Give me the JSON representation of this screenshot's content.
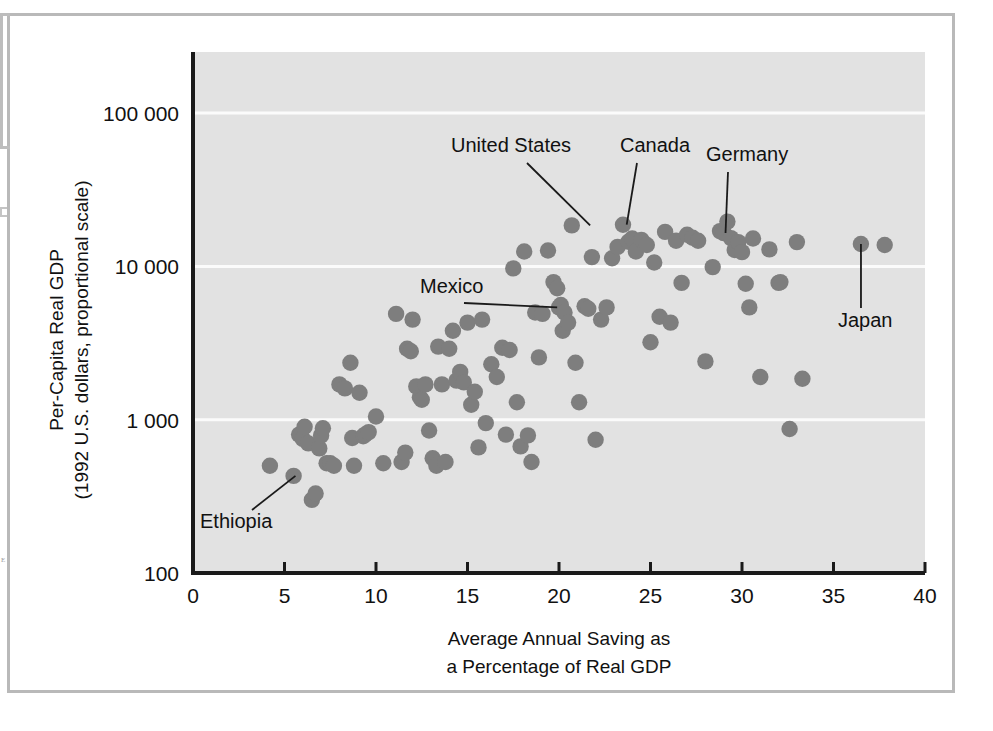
{
  "figure": {
    "plot_bg_color": "#e2e2e2",
    "point_color": "#7e7e7e",
    "grid_color": "#fbfbfb",
    "axis_color": "#1a1a1a",
    "margin_glyph": "E"
  },
  "axes": {
    "y_title_line1": "Per-Capita Real GDP",
    "y_title_line2": "(1992 U.S. dollars, proportional scale)",
    "x_title_line1": "Average Annual Saving as",
    "x_title_line2": "a Percentage of Real GDP",
    "y_tick_labels": [
      "100 000",
      "10 000",
      "1 000",
      "100"
    ],
    "x_tick_labels": [
      "0",
      "5",
      "10",
      "15",
      "20",
      "25",
      "30",
      "35",
      "40"
    ]
  },
  "annotations": [
    {
      "name": "United States",
      "label": "United States"
    },
    {
      "name": "Canada",
      "label": "Canada"
    },
    {
      "name": "Germany",
      "label": "Germany"
    },
    {
      "name": "Mexico",
      "label": "Mexico"
    },
    {
      "name": "Japan",
      "label": "Japan"
    },
    {
      "name": "Ethiopia",
      "label": "Ethiopia"
    }
  ],
  "chart_data": {
    "type": "scatter",
    "title": "",
    "xlabel": "Average Annual Saving as a Percentage of Real GDP",
    "ylabel": "Per-Capita Real GDP (1992 U.S. dollars, proportional scale)",
    "xlim": [
      0,
      40
    ],
    "ylim": [
      100,
      300000
    ],
    "yscale": "log",
    "xticks": [
      0,
      5,
      10,
      15,
      20,
      25,
      30,
      35,
      40
    ],
    "yticks": [
      100,
      1000,
      10000,
      100000
    ],
    "ytick_labels": [
      "100",
      "1 000",
      "10 000",
      "100 000"
    ],
    "grid": "horizontal-major-only",
    "legend": "none",
    "x": [
      4.2,
      5.5,
      5.8,
      6.0,
      6.1,
      6.3,
      6.5,
      6.7,
      6.9,
      7.0,
      7.1,
      7.3,
      7.5,
      7.7,
      8.0,
      8.3,
      8.6,
      8.7,
      8.8,
      9.1,
      9.3,
      9.4,
      9.6,
      10.0,
      10.4,
      11.1,
      11.4,
      11.6,
      11.7,
      11.9,
      12.0,
      12.2,
      12.4,
      12.5,
      12.7,
      12.9,
      13.1,
      13.3,
      13.4,
      13.6,
      13.8,
      14.0,
      14.2,
      14.4,
      14.6,
      14.8,
      15.0,
      15.2,
      15.4,
      15.6,
      15.8,
      16.0,
      16.3,
      16.6,
      16.9,
      17.1,
      17.3,
      17.5,
      17.7,
      17.9,
      18.1,
      18.3,
      18.5,
      18.7,
      18.9,
      19.1,
      19.4,
      19.7,
      19.9,
      20.0,
      20.1,
      20.2,
      20.3,
      20.5,
      20.7,
      20.9,
      21.1,
      21.4,
      21.6,
      21.8,
      22.0,
      22.3,
      22.6,
      22.9,
      23.2,
      23.5,
      23.8,
      24.0,
      24.2,
      24.5,
      24.8,
      25.0,
      25.2,
      25.5,
      25.8,
      26.1,
      26.4,
      26.7,
      27.0,
      27.3,
      27.6,
      28.0,
      28.4,
      28.8,
      29.0,
      29.2,
      29.4,
      29.6,
      29.8,
      30.0,
      30.2,
      30.4,
      30.6,
      31.0,
      31.5,
      32.0,
      32.1,
      32.6,
      33.0,
      33.3,
      36.5,
      37.8
    ],
    "y": [
      500,
      430,
      800,
      750,
      900,
      700,
      300,
      330,
      650,
      790,
      880,
      520,
      520,
      500,
      1700,
      1600,
      2350,
      760,
      500,
      1500,
      780,
      800,
      830,
      1050,
      520,
      4900,
      530,
      610,
      2900,
      2800,
      4500,
      1650,
      1400,
      1350,
      1700,
      850,
      560,
      500,
      3000,
      1700,
      530,
      2900,
      3800,
      1800,
      2050,
      1750,
      4300,
      1250,
      1520,
      660,
      4500,
      950,
      2300,
      1900,
      2950,
      800,
      2850,
      9700,
      1300,
      670,
      12500,
      790,
      530,
      5000,
      2550,
      4900,
      12700,
      7900,
      7200,
      5400,
      5600,
      3800,
      5000,
      4300,
      18500,
      2350,
      1300,
      5500,
      5300,
      11500,
      740,
      4500,
      5400,
      11300,
      13400,
      18700,
      14500,
      15200,
      12500,
      14900,
      13800,
      3200,
      10600,
      4700,
      16800,
      4300,
      14700,
      7800,
      16100,
      15400,
      14700,
      2400,
      9900,
      17000,
      16500,
      19600,
      15300,
      12800,
      14400,
      12400,
      7700,
      5400,
      15200,
      1900,
      12900,
      7800,
      7900,
      870,
      14400,
      1850,
      14000,
      13800
    ],
    "labeled_points": [
      {
        "label": "United States",
        "x": 21.7,
        "y": 18500
      },
      {
        "label": "Canada",
        "x": 23.7,
        "y": 18700
      },
      {
        "label": "Germany",
        "x": 29.1,
        "y": 16500
      },
      {
        "label": "Mexico",
        "x": 19.9,
        "y": 5400
      },
      {
        "label": "Japan",
        "x": 36.5,
        "y": 14000
      },
      {
        "label": "Ethiopia",
        "x": 5.6,
        "y": 430
      }
    ]
  }
}
